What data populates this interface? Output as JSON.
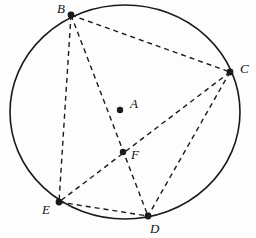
{
  "figure": {
    "canvas": {
      "width": 256,
      "height": 238
    },
    "background_color": "#fdfdfd",
    "stroke_color": "#1a1a1a",
    "circle": {
      "name": "circumscribed-circle",
      "center_x": 125,
      "center_y": 112,
      "radius_x": 115,
      "radius_y": 107,
      "stroke_width": 1.6,
      "style": "solid"
    },
    "chord_style": {
      "stroke_width": 1.4,
      "dash_pattern": "5,4",
      "style": "dashed"
    }
  },
  "points": [
    {
      "id": "A",
      "label": "A",
      "x": 120,
      "y": 110,
      "label_x": 130,
      "label_y": 97,
      "role": "center",
      "dot_radius": 3.2
    },
    {
      "id": "B",
      "label": "B",
      "x": 71,
      "y": 15,
      "label_x": 57,
      "label_y": 2,
      "role": "on-circle",
      "dot_radius": 3.4
    },
    {
      "id": "C",
      "label": "C",
      "x": 230,
      "y": 72,
      "label_x": 240,
      "label_y": 62,
      "role": "on-circle",
      "dot_radius": 3.4
    },
    {
      "id": "D",
      "label": "D",
      "x": 148,
      "y": 216,
      "label_x": 150,
      "label_y": 222,
      "role": "on-circle",
      "dot_radius": 3.4
    },
    {
      "id": "E",
      "label": "E",
      "x": 59,
      "y": 202,
      "label_x": 42,
      "label_y": 203,
      "role": "on-circle",
      "dot_radius": 3.4
    },
    {
      "id": "F",
      "label": "F",
      "x": 123,
      "y": 152,
      "label_x": 131,
      "label_y": 148,
      "role": "intersection",
      "dot_radius": 3.2
    }
  ],
  "chords": [
    {
      "id": "BC",
      "from": "B",
      "to": "C",
      "name": "chord-b-c"
    },
    {
      "id": "BE",
      "from": "B",
      "to": "E",
      "name": "chord-b-e"
    },
    {
      "id": "BD",
      "from": "B",
      "to": "D",
      "name": "chord-b-d"
    },
    {
      "id": "CE",
      "from": "C",
      "to": "E",
      "name": "chord-c-e"
    },
    {
      "id": "CD",
      "from": "C",
      "to": "D",
      "name": "chord-c-d"
    },
    {
      "id": "ED",
      "from": "E",
      "to": "D",
      "name": "chord-e-d"
    }
  ]
}
